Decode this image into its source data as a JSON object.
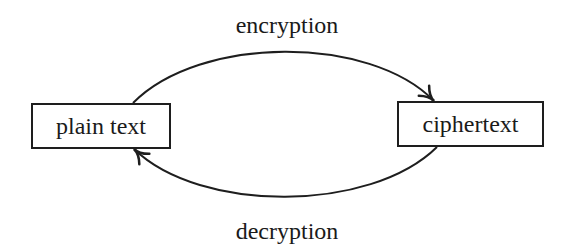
{
  "diagram": {
    "type": "flow",
    "nodes": [
      {
        "id": "plain",
        "label": "plain text"
      },
      {
        "id": "cipher",
        "label": "ciphertext"
      }
    ],
    "edges": [
      {
        "from": "plain",
        "to": "cipher",
        "label": "encryption",
        "position": "top"
      },
      {
        "from": "cipher",
        "to": "plain",
        "label": "decryption",
        "position": "bottom"
      }
    ],
    "colors": {
      "stroke": "#1e1e1e",
      "background": "#ffffff",
      "text": "#1a1a1a"
    }
  }
}
